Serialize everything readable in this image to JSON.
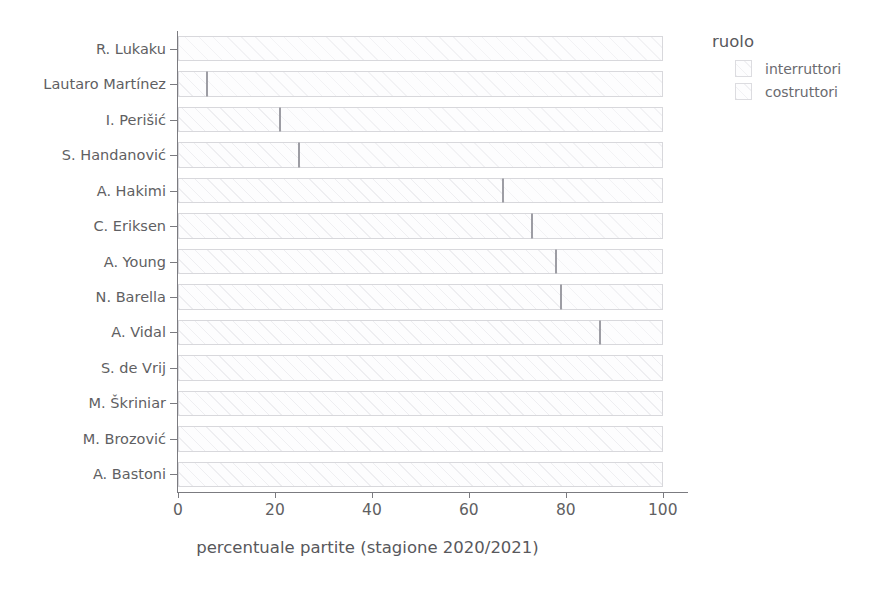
{
  "chart_data": {
    "type": "bar",
    "orientation": "horizontal",
    "stacked": true,
    "title": "",
    "xlabel": "percentuale partite (stagione 2020/2021)",
    "ylabel": "",
    "xlim": [
      0,
      105
    ],
    "xticks": [
      0,
      20,
      40,
      60,
      80,
      100
    ],
    "xticklabels": [
      "0",
      "20",
      "40",
      "60",
      "80",
      "100"
    ],
    "grid": false,
    "legend": {
      "title": "ruolo",
      "position": "right",
      "entries": [
        "interruttori",
        "costruttori"
      ]
    },
    "categories": [
      "R. Lukaku",
      "Lautaro Martínez",
      "I. Perišić",
      "S. Handanović",
      "A. Hakimi",
      "C. Eriksen",
      "A. Young",
      "N. Barella",
      "A. Vidal",
      "S. de Vrij",
      "M. Škriniar",
      "M. Brozović",
      "A. Bastoni"
    ],
    "series": [
      {
        "name": "interruttori",
        "values": [
          0,
          6,
          21,
          25,
          67,
          73,
          78,
          79,
          87,
          100,
          100,
          100,
          100
        ]
      },
      {
        "name": "costruttori",
        "values": [
          100,
          94,
          79,
          75,
          33,
          27,
          22,
          21,
          13,
          0,
          0,
          0,
          0
        ]
      }
    ]
  },
  "axis": {
    "x_title": "percentuale partite (stagione 2020/2021)",
    "x_tick_labels": [
      "0",
      "20",
      "40",
      "60",
      "80",
      "100"
    ],
    "y_tick_labels": [
      "R. Lukaku",
      "Lautaro Martínez",
      "I. Perišić",
      "S. Handanović",
      "A. Hakimi",
      "C. Eriksen",
      "A. Young",
      "N. Barella",
      "A. Vidal",
      "S. de Vrij",
      "M. Škriniar",
      "M. Brozović",
      "A. Bastoni"
    ]
  },
  "legend": {
    "title": "ruolo",
    "items": [
      {
        "label": "interruttori"
      },
      {
        "label": "costruttori"
      }
    ]
  },
  "colors": {
    "bar_fill": "#fdfdfe",
    "bar_border": "#d8d8dc",
    "divider": "#9d9da4",
    "axis": "#7b7b80",
    "text": "#5f5f63"
  }
}
